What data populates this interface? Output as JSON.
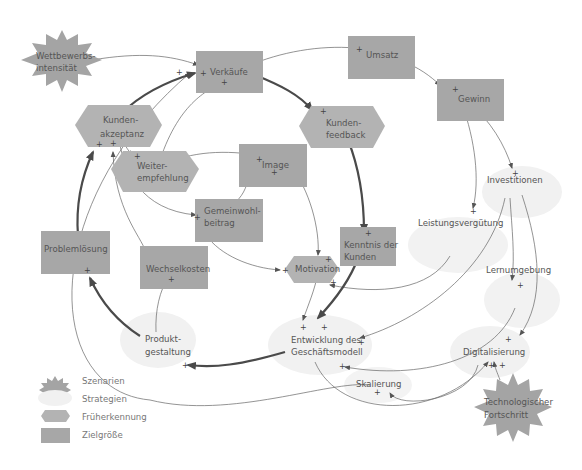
{
  "colors": {
    "zielgroesse": "#a7a7a7",
    "fruehererkennung": "#b3b3b3",
    "strategien": "#f1f1f1",
    "szenarien": "#a4a4a4",
    "arrow": "#555555",
    "arrow_strong": "#4a4a4a"
  },
  "nodes": {
    "wettbewerbsintensitaet": {
      "line1": "Wettbewerbs-",
      "line2": "intensität",
      "type": "Szenarien"
    },
    "verkaeufe": {
      "label": "Verkäufe",
      "type": "Zielgröße"
    },
    "umsatz": {
      "label": "Umsatz",
      "type": "Zielgröße"
    },
    "gewinn": {
      "label": "Gewinn",
      "type": "Zielgröße"
    },
    "kundenakzeptanz": {
      "line1": "Kunden-",
      "line2": "akzeptanz",
      "type": "Früherkennung"
    },
    "kundenfeedback": {
      "line1": "Kunden-",
      "line2": "feedback",
      "type": "Früherkennung"
    },
    "weiterempfehlung": {
      "line1": "Weiter-",
      "line2": "empfehlung",
      "type": "Früherkennung"
    },
    "image": {
      "label": "Image",
      "type": "Zielgröße"
    },
    "gemeinwohlbeitrag": {
      "line1": "Gemeinwohl-",
      "line2": "beitrag",
      "type": "Zielgröße"
    },
    "investitionen": {
      "label": "Investitionen",
      "type": "Strategien"
    },
    "leistungsverguetung": {
      "label": "Leistungsvergütung",
      "type": "Strategien"
    },
    "problemloesung": {
      "label": "Problemlösung",
      "type": "Zielgröße"
    },
    "wechselkosten": {
      "label": "Wechselkosten",
      "type": "Zielgröße"
    },
    "kenntnis_der_kunden": {
      "line1": "Kenntnis der",
      "line2": "Kunden",
      "type": "Zielgröße"
    },
    "motivation": {
      "label": "Motivation",
      "type": "Früherkennung"
    },
    "lernumgebung": {
      "label": "Lernumgebung",
      "type": "Strategien"
    },
    "produktgestaltung": {
      "line1": "Produkt-",
      "line2": "gestaltung",
      "type": "Strategien"
    },
    "entwicklung_geschaeftsmodell": {
      "line1": "Entwicklung des",
      "line2": "Geschäftsmodell",
      "type": "Strategien"
    },
    "digitalisierung": {
      "label": "Digitalisierung",
      "type": "Strategien"
    },
    "skalierung": {
      "label": "Skalierung",
      "type": "Strategien"
    },
    "technologischer_fortschritt": {
      "line1": "Technologischer",
      "line2": "Fortschritt",
      "type": "Szenarien"
    }
  },
  "polarity": {
    "plus": "+"
  },
  "legend": {
    "items": [
      {
        "label": "Szenarien",
        "shape": "star"
      },
      {
        "label": "Strategien",
        "shape": "ellipse"
      },
      {
        "label": "Früherkennung",
        "shape": "hexagon"
      },
      {
        "label": "Zielgröße",
        "shape": "rectangle"
      }
    ]
  }
}
